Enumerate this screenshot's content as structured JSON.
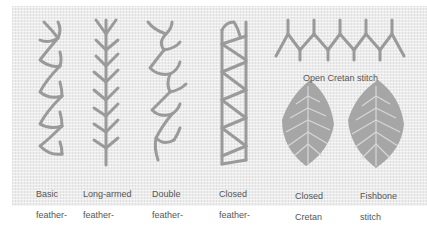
{
  "figure": {
    "stitch_color": "#9a9a9a",
    "fabric_color": "#ececec",
    "stitches": [
      {
        "id": "basic-feather-stitch",
        "lines": [
          "Basic",
          "feather-",
          "stitch"
        ]
      },
      {
        "id": "long-armed-feather-stitch",
        "lines": [
          "Long-armed",
          "feather-",
          "stitch"
        ]
      },
      {
        "id": "double-feather-stitch",
        "lines": [
          "Double",
          "feather-",
          "stitch"
        ]
      },
      {
        "id": "closed-feather-stitch",
        "lines": [
          "Closed",
          "feather-",
          "stitch"
        ]
      },
      {
        "id": "open-cretan-stitch",
        "lines": [
          "Open Cretan stitch"
        ]
      },
      {
        "id": "closed-cretan-stitch",
        "lines": [
          "Closed",
          "Cretan",
          "stitch"
        ]
      },
      {
        "id": "fishbone-stitch",
        "lines": [
          "Fishbone",
          "stitch"
        ]
      }
    ]
  }
}
